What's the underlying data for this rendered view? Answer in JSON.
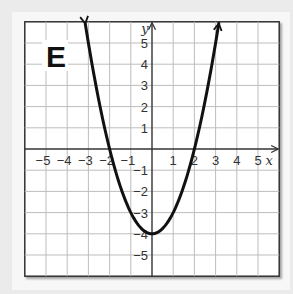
{
  "panel": {
    "label": "E"
  },
  "colors": {
    "background": "#ebebeb",
    "panel": "#f7f7f7",
    "plot_area": "#ffffff",
    "grid": "#bdbdbd",
    "axis": "#333333",
    "curve": "#111111",
    "frame": "#333333"
  },
  "chart_data": {
    "type": "line",
    "title": "E",
    "function": "y = x^2 - 4",
    "xlabel": "x",
    "ylabel": "y",
    "xlim": [
      -6,
      6
    ],
    "ylim": [
      -6,
      6
    ],
    "grid": true,
    "x_ticks": [
      -5,
      -4,
      -3,
      -2,
      -1,
      1,
      2,
      3,
      4,
      5
    ],
    "y_ticks": [
      5,
      4,
      3,
      2,
      1,
      -1,
      -2,
      -3,
      -4,
      -5
    ],
    "x_tick_labels": [
      "−5",
      "−4",
      "−3",
      "−2",
      "−1",
      "1",
      "2",
      "3",
      "4",
      "5"
    ],
    "y_tick_labels": [
      "5",
      "4",
      "3",
      "2",
      "1",
      "−1",
      "−2",
      "−3",
      "−4",
      "−5"
    ],
    "series": [
      {
        "name": "parabola",
        "x_range": [
          -3.15,
          3.15
        ],
        "arrows_at_ends": true,
        "key_points": {
          "vertex": [
            0,
            -4
          ],
          "roots": [
            -2,
            2
          ]
        },
        "x": [
          -3,
          -2,
          -1,
          0,
          1,
          2,
          3
        ],
        "y": [
          5,
          0,
          -3,
          -4,
          -3,
          0,
          5
        ]
      }
    ],
    "legend": null
  },
  "geometry": {
    "origin_px": [
      152,
      149
    ],
    "unit_px": 21.2
  }
}
